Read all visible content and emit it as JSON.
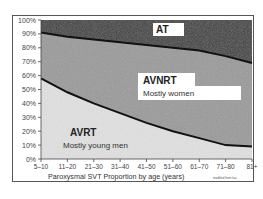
{
  "chart_data": {
    "type": "area",
    "stacked": true,
    "normalized_percent": true,
    "title": "",
    "xlabel": "Paroxysmal SVT Proportion by age (years)",
    "ylabel": "",
    "note": "modified from lsai",
    "categories": [
      "5–10",
      "11–20",
      "21–30",
      "31–40",
      "41–50",
      "51–60",
      "61–70",
      "71–80",
      "81+"
    ],
    "y_ticks": [
      "0%",
      "10%",
      "20%",
      "30%",
      "40%",
      "50%",
      "60%",
      "70%",
      "80%",
      "90%",
      "100%"
    ],
    "ylim": [
      0,
      100
    ],
    "grid": false,
    "legend": "inline labels",
    "series": [
      {
        "name": "AVRT",
        "annotation": "Mostly young men",
        "color": "#e2e2e2",
        "values": [
          58,
          48,
          40,
          33,
          26,
          20,
          15,
          10,
          9
        ]
      },
      {
        "name": "AVNRT",
        "annotation": "Mostly women",
        "color": "#9a9a9a",
        "values": [
          33,
          40,
          46,
          51,
          56,
          60,
          63,
          64,
          60
        ]
      },
      {
        "name": "AT",
        "annotation": "",
        "color": "#3a3a3a",
        "values": [
          9,
          12,
          14,
          16,
          18,
          20,
          22,
          26,
          31
        ]
      }
    ]
  },
  "labels": {
    "at": "AT",
    "avnrt": "AVNRT",
    "avnrt_sub": "Mostly women",
    "avrt": "AVRT",
    "avrt_sub": "Mostly young men"
  }
}
